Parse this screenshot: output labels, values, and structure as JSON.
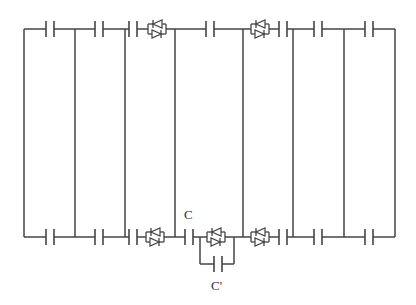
{
  "diagram": {
    "type": "circuit-ladder",
    "colors": {
      "wire": "#444444",
      "background": "#ffffff",
      "label": "#333333"
    },
    "labels": {
      "capacitor_c": "C",
      "capacitor_c_prime": "C'"
    },
    "top_rail": {
      "y": 29,
      "components": [
        {
          "kind": "capacitor",
          "x": 50
        },
        {
          "kind": "capacitor",
          "x": 99
        },
        {
          "kind": "capacitor",
          "x": 133
        },
        {
          "kind": "antiparallel-diodes",
          "x": 157
        },
        {
          "kind": "capacitor",
          "x": 210
        },
        {
          "kind": "antiparallel-diodes",
          "x": 260
        },
        {
          "kind": "capacitor",
          "x": 283
        },
        {
          "kind": "capacitor",
          "x": 318
        },
        {
          "kind": "capacitor",
          "x": 369
        }
      ]
    },
    "bottom_rail": {
      "y": 237,
      "components": [
        {
          "kind": "capacitor",
          "x": 50
        },
        {
          "kind": "capacitor",
          "x": 99
        },
        {
          "kind": "capacitor",
          "x": 133
        },
        {
          "kind": "antiparallel-diodes",
          "x": 155
        },
        {
          "kind": "capacitor",
          "x": 189,
          "label": "C"
        },
        {
          "kind": "antiparallel-diodes",
          "x": 216,
          "bypass_capacitor": "C'"
        },
        {
          "kind": "antiparallel-diodes",
          "x": 260
        },
        {
          "kind": "capacitor",
          "x": 283
        },
        {
          "kind": "capacitor",
          "x": 318
        },
        {
          "kind": "capacitor",
          "x": 369
        }
      ]
    },
    "verticals_x": [
      24,
      75,
      125,
      175,
      243,
      293,
      344,
      395
    ]
  }
}
